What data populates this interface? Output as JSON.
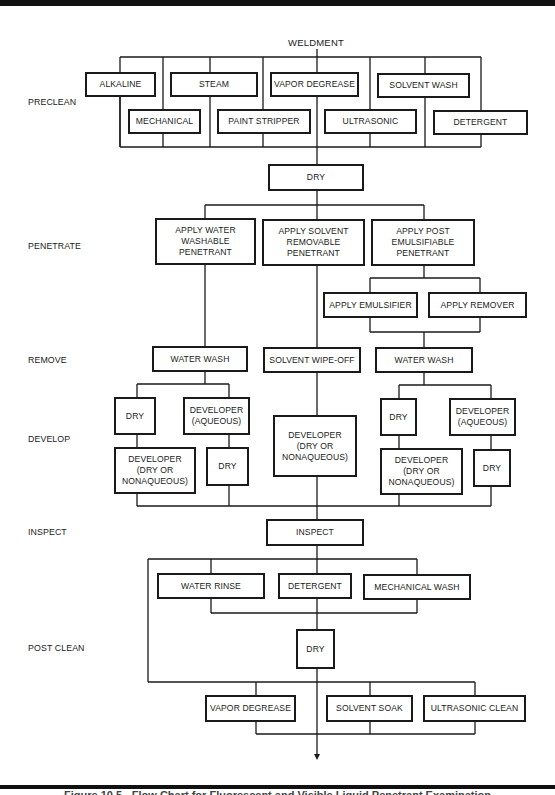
{
  "diagram": {
    "start": "WELDMENT",
    "stages": {
      "preclean": "PRECLEAN",
      "penetrate": "PENETRATE",
      "remove": "REMOVE",
      "develop": "DEVELOP",
      "inspect": "INSPECT",
      "post_clean": "POST CLEAN"
    },
    "preclean": {
      "alkaline": "ALKALINE",
      "steam": "STEAM",
      "vapor_degrease": "VAPOR DEGREASE",
      "solvent_wash": "SOLVENT WASH",
      "mechanical": "MECHANICAL",
      "paint_stripper": "PAINT STRIPPER",
      "ultrasonic": "ULTRASONIC",
      "detergent": "DETERGENT",
      "dry": "DRY"
    },
    "penetrate": {
      "water_washable": "APPLY WATER\nWASHABLE\nPENETRANT",
      "solvent_removable": "APPLY SOLVENT\nREMOVABLE\nPENETRANT",
      "post_emulsifiable": "APPLY POST\nEMULSIFIABLE\nPENETRANT",
      "apply_emulsifier": "APPLY EMULSIFIER",
      "apply_remover": "APPLY REMOVER"
    },
    "remove": {
      "water_wash_left": "WATER WASH",
      "solvent_wipe_off": "SOLVENT WIPE-OFF",
      "water_wash_right": "WATER WASH"
    },
    "develop": {
      "left_dry_1": "DRY",
      "left_dev_aqueous": "DEVELOPER\n(AQUEOUS)",
      "left_dev_dry_nonaq": "DEVELOPER\n(DRY OR\nNONAQUEOUS)",
      "left_dry_2": "DRY",
      "center_dev_dry_nonaq": "DEVELOPER\n(DRY OR\nNONAQUEOUS)",
      "right_dry_1": "DRY",
      "right_dev_aqueous": "DEVELOPER\n(AQUEOUS)",
      "right_dev_dry_nonaq": "DEVELOPER\n(DRY OR\nNONAQUEOUS)",
      "right_dry_2": "DRY"
    },
    "inspect": {
      "inspect": "INSPECT"
    },
    "post_clean": {
      "water_rinse": "WATER RINSE",
      "detergent": "DETERGENT",
      "mechanical_wash": "MECHANICAL WASH",
      "dry": "DRY",
      "vapor_degrease": "VAPOR DEGREASE",
      "solvent_soak": "SOLVENT SOAK",
      "ultrasonic_clean": "ULTRASONIC CLEAN"
    },
    "caption": "Figure 10.5 - Flow Chart for Fluorescent and Visible Liquid Penetrant Examination"
  }
}
